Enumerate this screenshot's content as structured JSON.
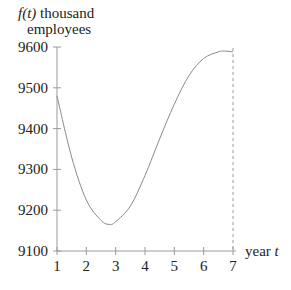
{
  "chart_data": {
    "type": "line",
    "title": "",
    "ylabel_line1_func": "f(t)",
    "ylabel_line1_rest": " thousand",
    "ylabel_line2": "employees",
    "xlabel_word": "year ",
    "xlabel_var": "t",
    "xlim": [
      1,
      7
    ],
    "ylim": [
      9100,
      9600
    ],
    "x_ticks": [
      "1",
      "2",
      "3",
      "4",
      "5",
      "6",
      "7"
    ],
    "y_ticks": [
      "9100",
      "9200",
      "9300",
      "9400",
      "9500",
      "9600"
    ],
    "grid": false,
    "annotations": [
      "dashed vertical line at t = 7"
    ],
    "series": [
      {
        "name": "f(t)",
        "x": [
          1,
          1.5,
          2,
          2.5,
          2.8,
          3,
          3.5,
          4,
          4.5,
          5,
          5.5,
          6,
          6.5,
          6.7,
          7
        ],
        "y": [
          9480,
          9330,
          9225,
          9175,
          9165,
          9172,
          9210,
          9285,
          9375,
          9460,
          9530,
          9572,
          9588,
          9590,
          9588
        ]
      }
    ],
    "colors": {
      "line": "#8a8a8a",
      "axis": "#9a9a9a",
      "text": "#222222"
    }
  }
}
